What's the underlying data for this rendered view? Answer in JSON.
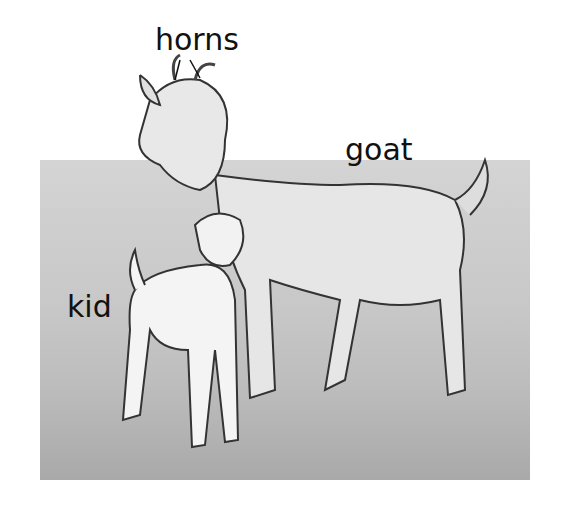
{
  "labels": {
    "horns": "horns",
    "goat": "goat",
    "kid": "kid"
  },
  "figure": {
    "style": "grayscale illustration"
  }
}
